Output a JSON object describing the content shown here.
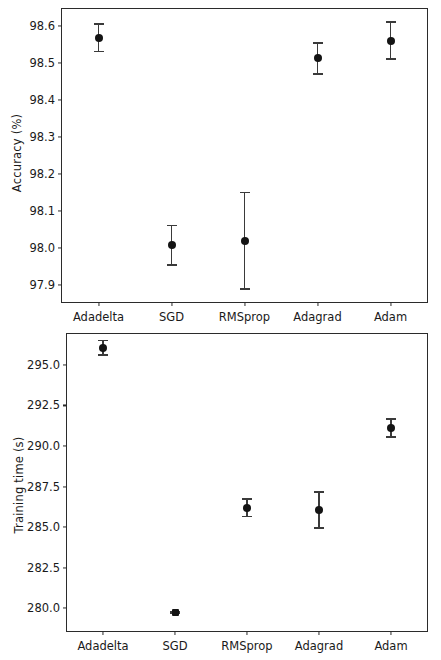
{
  "figure": {
    "width": 441,
    "height": 660,
    "marker_color": "#141414",
    "errorbar_color": "#3a3a3a",
    "axis_color": "#2b2b2b",
    "background": "#ffffff"
  },
  "chart_data": [
    {
      "type": "scatter",
      "id": "accuracy",
      "title": "",
      "xlabel": "",
      "ylabel": "Accuracy (%)",
      "categories": [
        "Adadelta",
        "SGD",
        "RMSprop",
        "Adagrad",
        "Adam"
      ],
      "values": [
        98.567,
        98.008,
        98.02,
        98.512,
        98.56
      ],
      "errors": [
        0.037,
        0.053,
        0.13,
        0.042,
        0.05
      ],
      "error_low": [
        98.53,
        97.955,
        97.89,
        98.47,
        98.51
      ],
      "error_high": [
        98.604,
        98.061,
        98.15,
        98.554,
        98.61
      ],
      "yticks": [
        97.9,
        98.0,
        98.1,
        98.2,
        98.3,
        98.4,
        98.5,
        98.6
      ],
      "ytick_labels": [
        "97.9",
        "98.0",
        "98.1",
        "98.2",
        "98.3",
        "98.4",
        "98.5",
        "98.6"
      ],
      "ylim": [
        97.855,
        98.645
      ],
      "grid": false,
      "legend": false
    },
    {
      "type": "scatter",
      "id": "training-time",
      "title": "",
      "xlabel": "",
      "ylabel": "Training time (s)",
      "categories": [
        "Adadelta",
        "SGD",
        "RMSprop",
        "Adagrad",
        "Adam"
      ],
      "values": [
        296.05,
        279.75,
        286.2,
        286.05,
        291.1
      ],
      "errors": [
        0.45,
        0.05,
        0.55,
        1.1,
        0.55
      ],
      "error_low": [
        295.6,
        279.7,
        285.65,
        284.95,
        290.55
      ],
      "error_high": [
        296.5,
        279.8,
        286.75,
        287.15,
        291.65
      ],
      "yticks": [
        280.0,
        282.5,
        285.0,
        287.5,
        290.0,
        292.5,
        295.0
      ],
      "ytick_labels": [
        "280.0",
        "282.5",
        "285.0",
        "287.5",
        "290.0",
        "292.5",
        "295.0"
      ],
      "ylim": [
        278.6,
        296.9
      ],
      "grid": false,
      "legend": false
    }
  ]
}
